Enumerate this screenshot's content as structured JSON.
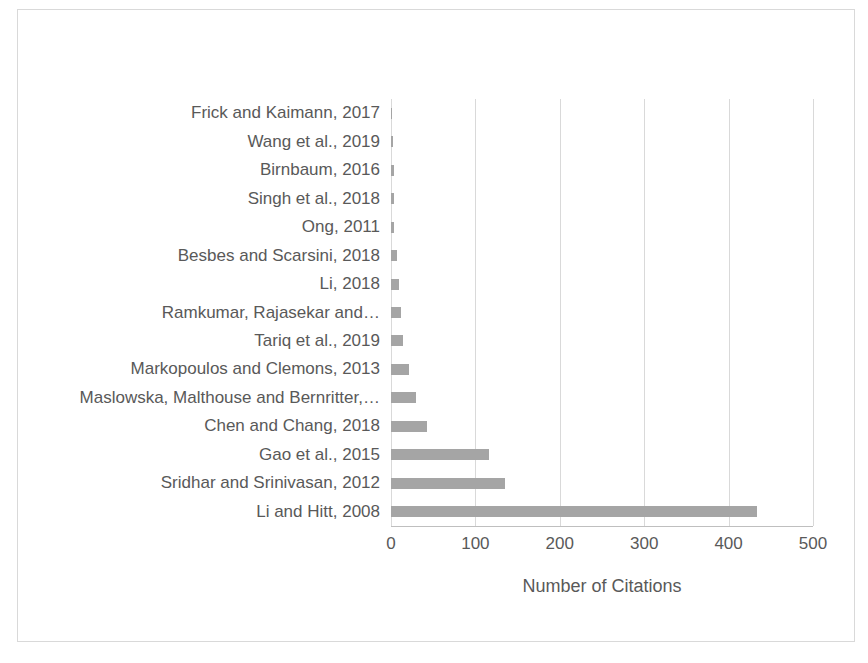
{
  "chart_data": {
    "type": "bar",
    "orientation": "horizontal",
    "title": "",
    "xlabel": "Number of Citations",
    "ylabel": "",
    "xlim": [
      0,
      500
    ],
    "xticks": [
      0,
      100,
      200,
      300,
      400,
      500
    ],
    "xtick_labels": [
      "0",
      "100",
      "200",
      "300",
      "400",
      "500"
    ],
    "grid": "vertical",
    "legend": "none",
    "bar_color": "#a5a5a5",
    "gridline_color": "#d9d9d9",
    "text_color": "#595959",
    "categories": [
      "Frick and Kaimann, 2017",
      "Wang et al., 2019",
      "Birnbaum, 2016",
      "Singh et al., 2018",
      "Ong, 2011",
      "Besbes and Scarsini, 2018",
      "Li, 2018",
      "Ramkumar, Rajasekar and…",
      "Tariq et al., 2019",
      "Markopoulos and Clemons, 2013",
      "Maslowska, Malthouse and Bernritter,…",
      "Chen and Chang, 2018",
      "Gao et al., 2015",
      "Sridhar and Srinivasan, 2012",
      "Li and Hitt, 2008"
    ],
    "values": [
      1,
      2,
      3,
      3,
      4,
      7,
      9,
      12,
      14,
      21,
      30,
      43,
      116,
      135,
      434
    ]
  }
}
